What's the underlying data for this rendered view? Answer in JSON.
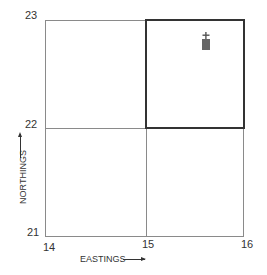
{
  "grid": {
    "x_labels": [
      "14",
      "15",
      "16"
    ],
    "y_labels": [
      "23",
      "22",
      "21"
    ],
    "highlighted_square": {
      "easting": "15",
      "northing": "22"
    }
  },
  "axes": {
    "x_title": "EASTINGS",
    "y_title": "NORTHINGS"
  },
  "symbol": {
    "name": "church-with-tower",
    "color": "#555555"
  }
}
